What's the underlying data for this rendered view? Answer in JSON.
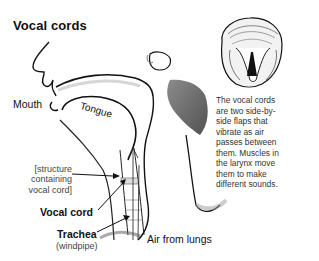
{
  "title": "Vocal cords",
  "labels": {
    "mouth": "Mouth",
    "tongue": "Tongue",
    "structure": [
      "[structure",
      "containing",
      "vocal cord]"
    ],
    "vocal_cord": "Vocal cord",
    "trachea": "Trachea",
    "windpipe": "(windpipe)",
    "air": "Air from lungs"
  },
  "description": "The vocal cords are two side-by-side flaps that vibrate as air passes between them. Muscles in the larynx move them to make different sounds.",
  "colors": {
    "ink": "#111111",
    "shade": "#555555",
    "background": "#ffffff"
  }
}
